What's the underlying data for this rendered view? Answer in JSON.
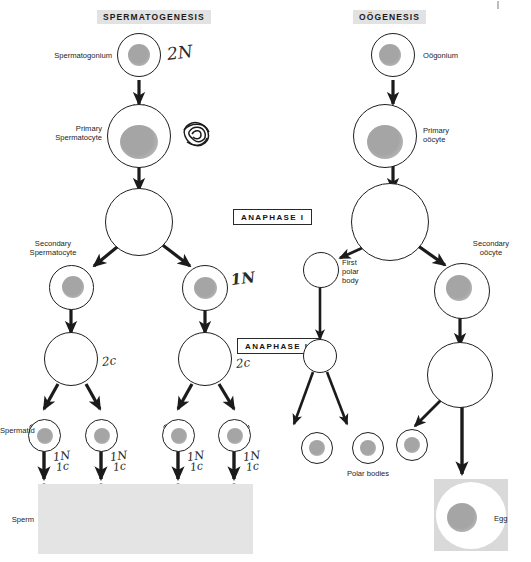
{
  "figure": {
    "title_left": "SPERMATOGENESIS",
    "title_right": "OÖGENESIS"
  },
  "phase_boxes": [
    {
      "label": "ANAPHASE I"
    },
    {
      "label": "ANAPHASE II"
    }
  ],
  "spermatogenesis": {
    "labels": [
      {
        "text": "Spermatogonium"
      },
      {
        "text": "Primary\nSpermatocyte"
      },
      {
        "text": "Secondary\nSpermatocyte"
      },
      {
        "text": "Spermatid"
      },
      {
        "text": "Sperm"
      }
    ],
    "annotations": [
      {
        "text": "2N"
      },
      {
        "text": "1N"
      },
      {
        "text": "2c"
      },
      {
        "text": "2c"
      },
      {
        "text": "1N"
      },
      {
        "text": "1c"
      },
      {
        "text": "1N"
      },
      {
        "text": "1c"
      },
      {
        "text": "1N"
      },
      {
        "text": "1c"
      },
      {
        "text": "1N"
      },
      {
        "text": "1c"
      }
    ]
  },
  "oogenesis": {
    "labels": [
      {
        "text": "Oögonium"
      },
      {
        "text": "Primary\noöcyte"
      },
      {
        "text": "Secondary\noöcyte"
      },
      {
        "text": "First\npolar\nbody"
      },
      {
        "text": "Polar bodies"
      },
      {
        "text": "Egg"
      }
    ]
  },
  "colors": {
    "header_bg": "#e2e2e2",
    "ink": "#1f1f1f",
    "nucleus": "#9a9a9a",
    "sperm_panel": "#e4e4e4",
    "egg_panel": "#d9d9d9"
  }
}
